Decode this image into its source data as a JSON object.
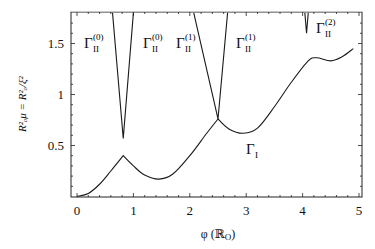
{
  "chart_data": {
    "type": "line",
    "title": "",
    "xlabel": "φ (ℝ_O)",
    "ylabel": "R_o^2 μ = R_o^2/ξ^2",
    "xlim": [
      -0.1,
      5.05
    ],
    "ylim": [
      0,
      1.8
    ],
    "x_ticks": [
      "0",
      "1",
      "2",
      "3",
      "4",
      "5"
    ],
    "y_ticks": [
      "0.5",
      "1",
      "1.5"
    ],
    "grid": false,
    "legend": null,
    "series": [
      {
        "name": "Γ_I",
        "x": [
          0.0,
          0.2,
          0.4,
          0.6,
          0.82,
          1.0,
          1.2,
          1.45,
          1.7,
          2.0,
          2.3,
          2.5,
          2.7,
          2.95,
          3.2,
          3.5,
          3.8,
          4.1,
          4.25,
          4.5,
          4.7,
          4.9
        ],
        "y": [
          0.0,
          0.03,
          0.12,
          0.25,
          0.4,
          0.3,
          0.21,
          0.17,
          0.22,
          0.4,
          0.62,
          0.76,
          0.66,
          0.62,
          0.67,
          0.88,
          1.12,
          1.33,
          1.36,
          1.33,
          1.37,
          1.45
        ]
      },
      {
        "name": "Γ_II^(0)",
        "x": [
          0.63,
          0.82,
          1.0
        ],
        "y": [
          1.8,
          0.57,
          1.8
        ]
      },
      {
        "name": "Γ_II^(1)",
        "x": [
          2.07,
          2.5,
          2.67
        ],
        "y": [
          1.8,
          0.76,
          1.8
        ]
      },
      {
        "name": "Γ_II^(2)",
        "x": [
          4.04,
          4.07,
          4.1
        ],
        "y": [
          1.8,
          1.6,
          1.8
        ]
      }
    ],
    "annotations": [
      {
        "text": "Γ_II^(0)",
        "x": 0.25,
        "y": 1.5
      },
      {
        "text": "Γ_II^(0)",
        "x": 1.05,
        "y": 1.5
      },
      {
        "text": "Γ_II^(1)",
        "x": 1.65,
        "y": 1.5
      },
      {
        "text": "Γ_II^(1)",
        "x": 2.75,
        "y": 1.5
      },
      {
        "text": "Γ_II^(2)",
        "x": 4.15,
        "y": 1.6
      },
      {
        "text": "Γ_I",
        "x": 3.2,
        "y": 0.45
      }
    ]
  },
  "labels": {
    "gamma": "Γ",
    "sub_II": "II",
    "sub_I": "I",
    "sup0": "(0)",
    "sup1": "(1)",
    "sup2": "(2)",
    "xtitle": "φ (ℝ",
    "xtitle_sub": "O",
    "xtitle_end": ")",
    "ytitle": "R",
    "ytitle_full": "R²ₒμ = R²ₒ/ξ²"
  }
}
